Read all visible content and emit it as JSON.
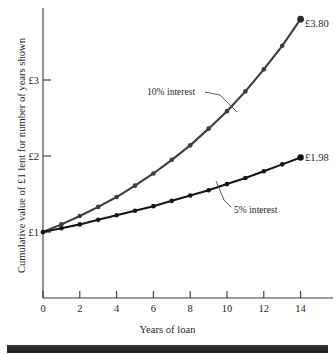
{
  "chart_data": {
    "type": "line",
    "title": "",
    "xlabel": "Years of loan",
    "ylabel": "Cumulative value of £1 lent for number of years shown",
    "x": [
      0,
      1,
      2,
      3,
      4,
      5,
      6,
      7,
      8,
      9,
      10,
      11,
      12,
      13,
      14
    ],
    "xlim": [
      0,
      16
    ],
    "ylim": [
      0,
      4
    ],
    "xticks": [
      0,
      2,
      4,
      6,
      8,
      10,
      12,
      14
    ],
    "xtick_labels": [
      "0",
      "2",
      "4",
      "6",
      "8",
      "10",
      "12",
      "14"
    ],
    "yticks": [
      1,
      2,
      3
    ],
    "ytick_labels": [
      "£1",
      "£2",
      "£3"
    ],
    "grid": false,
    "legend": "annotations-on-curves",
    "series": [
      {
        "name": "10% interest",
        "color": "#3d3d3d",
        "values": [
          1.0,
          1.1,
          1.21,
          1.33,
          1.46,
          1.61,
          1.77,
          1.95,
          2.14,
          2.36,
          2.59,
          2.85,
          3.14,
          3.45,
          3.8
        ],
        "end_label": "£3.80"
      },
      {
        "name": "5% interest",
        "color": "#161616",
        "values": [
          1.0,
          1.05,
          1.1,
          1.16,
          1.22,
          1.28,
          1.34,
          1.41,
          1.48,
          1.55,
          1.63,
          1.71,
          1.8,
          1.89,
          1.98
        ],
        "end_label": "£1.98"
      }
    ],
    "annotations": [
      {
        "text": "10% interest",
        "series": "10% interest"
      },
      {
        "text": "5% interest",
        "series": "5% interest"
      }
    ]
  },
  "labels": {
    "ylabel": "Cumulative value of £1 lent for number of years shown",
    "xlabel": "Years of loan",
    "ytick_1": "£1",
    "ytick_2": "£2",
    "ytick_3": "£3",
    "xtick_0": "0",
    "xtick_2": "2",
    "xtick_4": "4",
    "xtick_6": "6",
    "xtick_8": "8",
    "xtick_10": "10",
    "xtick_12": "12",
    "xtick_14": "14",
    "annotation_10": "10% interest",
    "annotation_5": "5% interest",
    "end_label_10": "£3.80",
    "end_label_5": "£1.98"
  },
  "colors": {
    "series_10": "#3d3d3d",
    "series_5": "#161616",
    "axis": "#3a3a3a",
    "background": "#ffffff",
    "bottom_bar": "#2a2a2c"
  }
}
